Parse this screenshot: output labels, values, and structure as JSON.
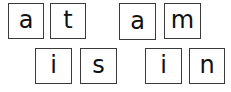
{
  "words": [
    {
      "word": "at",
      "letters": [
        "a",
        "t"
      ]
    },
    {
      "word": "am",
      "letters": [
        "a",
        "m"
      ]
    },
    {
      "word": "is",
      "letters": [
        "i",
        "s"
      ]
    },
    {
      "word": "in",
      "letters": [
        "i",
        "n"
      ]
    }
  ],
  "tiles": [
    {
      "letter": "a"
    },
    {
      "letter": "t"
    },
    {
      "letter": "a"
    },
    {
      "letter": "m"
    },
    {
      "letter": "i"
    },
    {
      "letter": "s"
    },
    {
      "letter": "i"
    },
    {
      "letter": "n"
    }
  ],
  "colors": {
    "border": "#3a3a3a",
    "text": "#111111",
    "background": "#ffffff"
  }
}
